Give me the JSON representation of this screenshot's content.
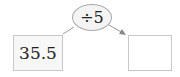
{
  "diagram": {
    "input_value": "35.5",
    "operation": "÷5",
    "output_value": "",
    "colors": {
      "border": "#c8c8c8",
      "arrow": "#888888",
      "oval_fill": "#f4f4f4"
    }
  }
}
